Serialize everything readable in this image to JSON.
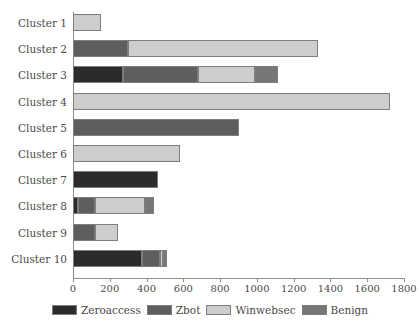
{
  "chart_data": {
    "type": "bar",
    "orientation": "horizontal",
    "stacked": true,
    "title": "",
    "xlabel": "",
    "ylabel": "",
    "xlim": [
      0,
      1800
    ],
    "xticks": [
      0,
      200,
      400,
      600,
      800,
      1000,
      1200,
      1400,
      1600,
      1800
    ],
    "xtick_labels": [
      "0",
      "200",
      "400",
      "600",
      "800",
      "1000",
      "1200",
      "1400",
      "1600",
      "1800"
    ],
    "grid": false,
    "legend_position": "bottom",
    "categories": [
      "Cluster 1",
      "Cluster 2",
      "Cluster 3",
      "Cluster 4",
      "Cluster 5",
      "Cluster 6",
      "Cluster 7",
      "Cluster 8",
      "Cluster 9",
      "Cluster 10"
    ],
    "series": [
      {
        "name": "Zeroaccess",
        "color": "#2b2b2b",
        "values": [
          0,
          0,
          270,
          0,
          0,
          0,
          460,
          25,
          0,
          375
        ]
      },
      {
        "name": "Zbot",
        "color": "#5e5e5e",
        "values": [
          0,
          300,
          410,
          0,
          900,
          0,
          0,
          95,
          120,
          100
        ]
      },
      {
        "name": "Winwebsec",
        "color": "#cdcdcd",
        "values": [
          150,
          1032,
          310,
          1725,
          0,
          580,
          0,
          270,
          125,
          15
        ]
      },
      {
        "name": "Benign",
        "color": "#777777",
        "values": [
          0,
          0,
          125,
          0,
          0,
          0,
          0,
          50,
          0,
          20
        ]
      }
    ],
    "totals": [
      150,
      1332,
      1115,
      1725,
      900,
      580,
      460,
      440,
      245,
      510
    ]
  },
  "legend": {
    "items": [
      {
        "label": "Zeroaccess",
        "color": "#2b2b2b"
      },
      {
        "label": "Zbot",
        "color": "#5e5e5e"
      },
      {
        "label": "Winwebsec",
        "color": "#cdcdcd"
      },
      {
        "label": "Benign",
        "color": "#777777"
      }
    ]
  },
  "axis": {
    "line_color": "#8f8f8f",
    "bar_border_color": "#7d7d7d"
  }
}
